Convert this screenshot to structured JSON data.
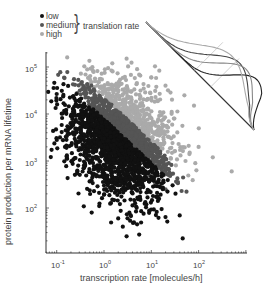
{
  "chart_data": {
    "type": "scatter",
    "title": "",
    "xlabel": "transcription rate [molecules/h]",
    "ylabel": "protein production per mRNA lifetime",
    "xscale": "log",
    "yscale": "log",
    "xlim": [
      0.05,
      1000
    ],
    "ylim": [
      15,
      200000
    ],
    "x_ticks": [
      {
        "base": "10",
        "exp": "-1",
        "value": 0.1
      },
      {
        "base": "10",
        "exp": "0",
        "value": 1
      },
      {
        "base": "10",
        "exp": "1",
        "value": 10
      },
      {
        "base": "10",
        "exp": "2",
        "value": 100
      }
    ],
    "y_ticks": [
      {
        "base": "10",
        "exp": "2",
        "value": 100
      },
      {
        "base": "10",
        "exp": "3",
        "value": 1000
      },
      {
        "base": "10",
        "exp": "4",
        "value": 10000
      },
      {
        "base": "10",
        "exp": "5",
        "value": 100000
      }
    ],
    "grid": false,
    "legend": {
      "title": "translation rate",
      "position": "top-left",
      "entries": [
        {
          "label": "low",
          "color": "#111111"
        },
        {
          "label": "medium",
          "color": "#555555"
        },
        {
          "label": "high",
          "color": "#aaaaaa"
        }
      ]
    },
    "series": [
      {
        "name": "low",
        "color": "#111111",
        "description": "ratio protein/transcription below lower band boundary",
        "sample_points": [
          [
            0.35,
            10000
          ],
          [
            0.6,
            9500
          ],
          [
            0.5,
            2700
          ],
          [
            0.4,
            1600
          ],
          [
            0.7,
            500
          ],
          [
            1,
            300
          ],
          [
            1.5,
            150
          ],
          [
            2,
            60
          ],
          [
            3,
            25
          ],
          [
            0.8,
            1000
          ],
          [
            1.2,
            700
          ],
          [
            0.55,
            80
          ],
          [
            2.5,
            40
          ],
          [
            5,
            45
          ]
        ]
      },
      {
        "name": "medium",
        "color": "#555555",
        "description": "intermediate translation rate band",
        "sample_points": [
          [
            0.7,
            20000
          ],
          [
            1,
            8000
          ],
          [
            1.5,
            5000
          ],
          [
            2.5,
            3000
          ],
          [
            4,
            1500
          ],
          [
            6,
            900
          ],
          [
            9,
            500
          ],
          [
            12,
            350
          ],
          [
            20,
            250
          ],
          [
            0.9,
            12000
          ]
        ]
      },
      {
        "name": "high",
        "color": "#aaaaaa",
        "description": "ratio above upper band boundary",
        "sample_points": [
          [
            1.5,
            120000
          ],
          [
            3,
            150000
          ],
          [
            5,
            90000
          ],
          [
            10,
            60000
          ],
          [
            20,
            40000
          ],
          [
            50,
            25000
          ],
          [
            80,
            15000
          ],
          [
            30,
            8000
          ],
          [
            15,
            4000
          ],
          [
            100,
            2000
          ],
          [
            200,
            1200
          ],
          [
            500,
            600
          ],
          [
            2,
            30000
          ],
          [
            8,
            20000
          ]
        ]
      }
    ],
    "point_count_estimate": 2500,
    "inset": {
      "description": "schematic of density curves projected along diagonal axis",
      "diagonal_line": {
        "from": [
          146,
          22
        ],
        "to": [
          254,
          130
        ]
      },
      "curves": [
        {
          "color": "#222222",
          "peak_offset": 0.78,
          "width": 0.2
        },
        {
          "color": "#444444",
          "peak_offset": 0.62,
          "width": 0.25
        },
        {
          "color": "#888888",
          "peak_offset": 0.68,
          "width": 0.22
        },
        {
          "color": "#aaaaaa",
          "peak_offset": 0.55,
          "width": 0.3
        }
      ]
    }
  },
  "legend": {
    "items": [
      {
        "label": "low",
        "color": "#111111"
      },
      {
        "label": "medium",
        "color": "#555555"
      },
      {
        "label": "high",
        "color": "#aaaaaa"
      }
    ],
    "group_label": "translation rate"
  },
  "axes": {
    "xlabel": "transcription rate [molecules/h]",
    "ylabel": "protein production per mRNA lifetime"
  }
}
